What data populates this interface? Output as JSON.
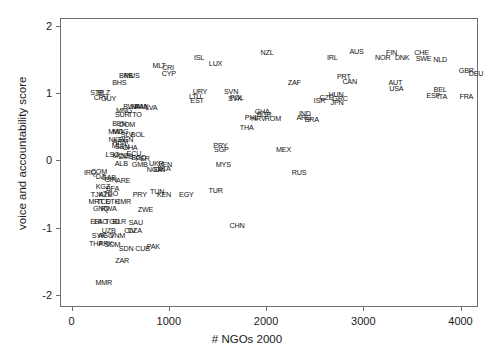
{
  "chart_data": {
    "type": "scatter",
    "title": "",
    "xlabel": "# NGOs 2000",
    "ylabel": "voice and accountability score",
    "xlim": [
      -120,
      4180
    ],
    "ylim": [
      -2.18,
      2.12
    ],
    "xticks": [
      0,
      1000,
      2000,
      3000,
      4000
    ],
    "yticks": [
      -2,
      -1,
      0,
      1,
      2
    ],
    "xtick_labels": [
      "0",
      "1000",
      "2000",
      "3000",
      "4000"
    ],
    "ytick_labels": [
      "-2",
      "-1",
      "0",
      "1",
      "2"
    ],
    "grid": false,
    "legend": false,
    "marker_style": "text-label",
    "point_color": "#111111",
    "frame_color": "#6e6e6e",
    "points": [
      {
        "label": "NZL",
        "x": 2010,
        "y": 1.6
      },
      {
        "label": "ISL",
        "x": 1310,
        "y": 1.53
      },
      {
        "label": "LUX",
        "x": 1480,
        "y": 1.44
      },
      {
        "label": "AUS",
        "x": 2930,
        "y": 1.62
      },
      {
        "label": "IRL",
        "x": 2680,
        "y": 1.53
      },
      {
        "label": "FIN",
        "x": 3290,
        "y": 1.6
      },
      {
        "label": "NOR",
        "x": 3200,
        "y": 1.52
      },
      {
        "label": "DNK",
        "x": 3400,
        "y": 1.52
      },
      {
        "label": "CHE",
        "x": 3600,
        "y": 1.6
      },
      {
        "label": "SWE",
        "x": 3620,
        "y": 1.51
      },
      {
        "label": "NLD",
        "x": 3790,
        "y": 1.5
      },
      {
        "label": "MLT",
        "x": 900,
        "y": 1.4
      },
      {
        "label": "CRI",
        "x": 990,
        "y": 1.37
      },
      {
        "label": "CYP",
        "x": 1000,
        "y": 1.29
      },
      {
        "label": "BRB",
        "x": 560,
        "y": 1.25
      },
      {
        "label": "MUS",
        "x": 620,
        "y": 1.25
      },
      {
        "label": "GBR",
        "x": 4060,
        "y": 1.33
      },
      {
        "label": "DEU",
        "x": 4160,
        "y": 1.29
      },
      {
        "label": "BHS",
        "x": 490,
        "y": 1.15
      },
      {
        "label": "ZAF",
        "x": 2290,
        "y": 1.15
      },
      {
        "label": "PRT",
        "x": 2800,
        "y": 1.24
      },
      {
        "label": "CAN",
        "x": 2860,
        "y": 1.17
      },
      {
        "label": "AUT",
        "x": 3330,
        "y": 1.15
      },
      {
        "label": "USA",
        "x": 3340,
        "y": 1.07
      },
      {
        "label": "STP",
        "x": 260,
        "y": 1.0
      },
      {
        "label": "BLZ",
        "x": 330,
        "y": 1.0
      },
      {
        "label": "CPV",
        "x": 300,
        "y": 0.93
      },
      {
        "label": "GUY",
        "x": 380,
        "y": 0.92
      },
      {
        "label": "URY",
        "x": 1320,
        "y": 1.02
      },
      {
        "label": "LTU",
        "x": 1270,
        "y": 0.94
      },
      {
        "label": "EST",
        "x": 1290,
        "y": 0.88
      },
      {
        "label": "SVN",
        "x": 1640,
        "y": 1.02
      },
      {
        "label": "SVK",
        "x": 1680,
        "y": 0.92
      },
      {
        "label": "POL",
        "x": 1700,
        "y": 0.93
      },
      {
        "label": "BEL",
        "x": 3790,
        "y": 1.05
      },
      {
        "label": "ESP",
        "x": 3720,
        "y": 0.96
      },
      {
        "label": "ITA",
        "x": 3810,
        "y": 0.95
      },
      {
        "label": "FRA",
        "x": 4060,
        "y": 0.94
      },
      {
        "label": "BWA",
        "x": 610,
        "y": 0.8
      },
      {
        "label": "NAM",
        "x": 690,
        "y": 0.8
      },
      {
        "label": "PAN",
        "x": 720,
        "y": 0.8
      },
      {
        "label": "LVA",
        "x": 820,
        "y": 0.78
      },
      {
        "label": "MNG",
        "x": 540,
        "y": 0.74
      },
      {
        "label": "SUR",
        "x": 520,
        "y": 0.68
      },
      {
        "label": "TTO",
        "x": 650,
        "y": 0.68
      },
      {
        "label": "ISR",
        "x": 2550,
        "y": 0.88
      },
      {
        "label": "CZE",
        "x": 2620,
        "y": 0.93
      },
      {
        "label": "HUN",
        "x": 2720,
        "y": 0.97
      },
      {
        "label": "GRC",
        "x": 2760,
        "y": 0.91
      },
      {
        "label": "JPN",
        "x": 2730,
        "y": 0.86
      },
      {
        "label": "GHA",
        "x": 1960,
        "y": 0.72
      },
      {
        "label": "BGR",
        "x": 1980,
        "y": 0.67
      },
      {
        "label": "PHL",
        "x": 1850,
        "y": 0.63
      },
      {
        "label": "HRV",
        "x": 1920,
        "y": 0.61
      },
      {
        "label": "ROM",
        "x": 2070,
        "y": 0.61
      },
      {
        "label": "IND",
        "x": 2400,
        "y": 0.69
      },
      {
        "label": "ARG",
        "x": 2390,
        "y": 0.63
      },
      {
        "label": "BRA",
        "x": 2470,
        "y": 0.6
      },
      {
        "label": "BEN",
        "x": 490,
        "y": 0.55
      },
      {
        "label": "DOM",
        "x": 570,
        "y": 0.53
      },
      {
        "label": "THA",
        "x": 1800,
        "y": 0.49
      },
      {
        "label": "MWI",
        "x": 450,
        "y": 0.43
      },
      {
        "label": "MDG",
        "x": 500,
        "y": 0.42
      },
      {
        "label": "SLV",
        "x": 570,
        "y": 0.38
      },
      {
        "label": "BOL",
        "x": 680,
        "y": 0.38
      },
      {
        "label": "NIC",
        "x": 440,
        "y": 0.3
      },
      {
        "label": "ARM",
        "x": 500,
        "y": 0.28
      },
      {
        "label": "BEN",
        "x": 560,
        "y": 0.3
      },
      {
        "label": "PRY",
        "x": 1530,
        "y": 0.22
      },
      {
        "label": "SGP",
        "x": 1540,
        "y": 0.15
      },
      {
        "label": "MEX",
        "x": 2180,
        "y": 0.16
      },
      {
        "label": "MLI",
        "x": 470,
        "y": 0.22
      },
      {
        "label": "SEN",
        "x": 520,
        "y": 0.2
      },
      {
        "label": "GHA",
        "x": 600,
        "y": 0.18
      },
      {
        "label": "LSO",
        "x": 420,
        "y": 0.08
      },
      {
        "label": "MOZ",
        "x": 500,
        "y": 0.07
      },
      {
        "label": "ZMB",
        "x": 560,
        "y": 0.05
      },
      {
        "label": "ECU",
        "x": 640,
        "y": 0.09
      },
      {
        "label": "BGD",
        "x": 690,
        "y": 0.04
      },
      {
        "label": "PER",
        "x": 730,
        "y": 0.02
      },
      {
        "label": "MYS",
        "x": 1560,
        "y": -0.07
      },
      {
        "label": "ALB",
        "x": 510,
        "y": -0.05
      },
      {
        "label": "GMB",
        "x": 700,
        "y": -0.06
      },
      {
        "label": "UKR",
        "x": 870,
        "y": -0.05
      },
      {
        "label": "VEN",
        "x": 960,
        "y": -0.07
      },
      {
        "label": "IRQ",
        "x": 190,
        "y": -0.18
      },
      {
        "label": "COM",
        "x": 280,
        "y": -0.17
      },
      {
        "label": "NGA",
        "x": 850,
        "y": -0.14
      },
      {
        "label": "IDN",
        "x": 900,
        "y": -0.14
      },
      {
        "label": "LKA",
        "x": 950,
        "y": -0.13
      },
      {
        "label": "RUS",
        "x": 2340,
        "y": -0.18
      },
      {
        "label": "DJI",
        "x": 300,
        "y": -0.25
      },
      {
        "label": "GAB",
        "x": 380,
        "y": -0.26
      },
      {
        "label": "GIN",
        "x": 400,
        "y": -0.29
      },
      {
        "label": "ARE",
        "x": 530,
        "y": -0.3
      },
      {
        "label": "KGZ",
        "x": 320,
        "y": -0.4
      },
      {
        "label": "BFA",
        "x": 420,
        "y": -0.42
      },
      {
        "label": "TJK",
        "x": 260,
        "y": -0.52
      },
      {
        "label": "AZE",
        "x": 350,
        "y": -0.52
      },
      {
        "label": "TGO",
        "x": 400,
        "y": -0.5
      },
      {
        "label": "PRY",
        "x": 700,
        "y": -0.52
      },
      {
        "label": "TUN",
        "x": 880,
        "y": -0.47
      },
      {
        "label": "KEN",
        "x": 950,
        "y": -0.52
      },
      {
        "label": "EGY",
        "x": 1180,
        "y": -0.52
      },
      {
        "label": "TUR",
        "x": 1480,
        "y": -0.46
      },
      {
        "label": "MRT",
        "x": 250,
        "y": -0.62
      },
      {
        "label": "TCD",
        "x": 330,
        "y": -0.62
      },
      {
        "label": "ETH",
        "x": 420,
        "y": -0.62
      },
      {
        "label": "CMR",
        "x": 530,
        "y": -0.62
      },
      {
        "label": "GNQ",
        "x": 300,
        "y": -0.72
      },
      {
        "label": "RWA",
        "x": 380,
        "y": -0.72
      },
      {
        "label": "ZWE",
        "x": 760,
        "y": -0.74
      },
      {
        "label": "ERI",
        "x": 250,
        "y": -0.92
      },
      {
        "label": "LAO",
        "x": 300,
        "y": -0.92
      },
      {
        "label": "TGO",
        "x": 420,
        "y": -0.92
      },
      {
        "label": "BLR",
        "x": 490,
        "y": -0.92
      },
      {
        "label": "SAU",
        "x": 660,
        "y": -0.93
      },
      {
        "label": "CHN",
        "x": 1700,
        "y": -0.97
      },
      {
        "label": "UZB",
        "x": 380,
        "y": -1.05
      },
      {
        "label": "CIV",
        "x": 600,
        "y": -1.05
      },
      {
        "label": "DZA",
        "x": 650,
        "y": -1.05
      },
      {
        "label": "SYR",
        "x": 280,
        "y": -1.13
      },
      {
        "label": "AGO",
        "x": 350,
        "y": -1.12
      },
      {
        "label": "VNM",
        "x": 470,
        "y": -1.13
      },
      {
        "label": "THA",
        "x": 250,
        "y": -1.25
      },
      {
        "label": "PRK",
        "x": 350,
        "y": -1.24
      },
      {
        "label": "SOM",
        "x": 420,
        "y": -1.26
      },
      {
        "label": "SDN",
        "x": 560,
        "y": -1.32
      },
      {
        "label": "CUB",
        "x": 730,
        "y": -1.32
      },
      {
        "label": "PAK",
        "x": 840,
        "y": -1.28
      },
      {
        "label": "ZAR",
        "x": 520,
        "y": -1.5
      },
      {
        "label": "MMR",
        "x": 330,
        "y": -1.83
      }
    ]
  }
}
